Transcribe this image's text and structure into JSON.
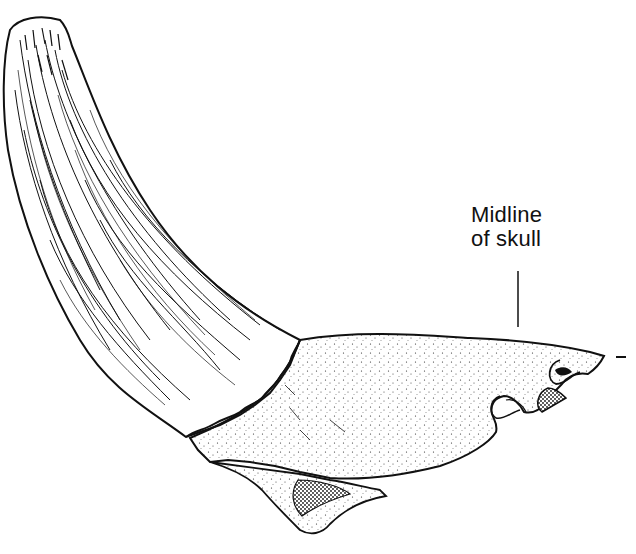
{
  "figure": {
    "annotation": {
      "line1": "Midline",
      "line2": "of skull"
    },
    "colors": {
      "ink": "#111111",
      "background": "#ffffff"
    }
  }
}
